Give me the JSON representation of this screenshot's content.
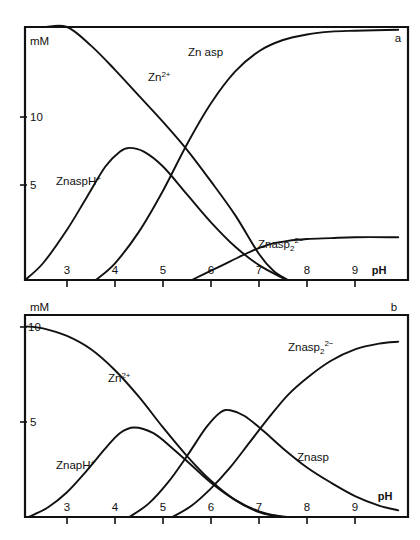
{
  "figure": {
    "panel_a_id": "a",
    "panel_b_id": "b"
  },
  "axes": {
    "y_title": "mM",
    "x_title": "pH",
    "panel_a": {
      "y_ticks": [
        "10",
        "5"
      ],
      "x_ticks": [
        "3",
        "4",
        "5",
        "6",
        "7",
        "8",
        "9"
      ]
    },
    "panel_b": {
      "y_ticks": [
        "10",
        "5"
      ],
      "x_ticks": [
        "3",
        "4",
        "5",
        "6",
        "7",
        "8",
        "9"
      ]
    }
  },
  "labels": {
    "a": {
      "zn2plus": "Zn",
      "zn2plus_sup": "2+",
      "znasp": "Zn asp",
      "znasph": "ZnaspH",
      "znasph_sup": "+",
      "znasp2": "Znasp",
      "znasp2_sub": "2",
      "znasp2_sup": "2−"
    },
    "b": {
      "zn2plus": "Zn",
      "zn2plus_sup": "2+",
      "znasp": "Znasp",
      "znasph": "ZnapH",
      "znasph_sup": "+",
      "znasp2": "Znasp",
      "znasp2_sub": "2",
      "znasp2_sup": "2−"
    }
  },
  "chart_data": [
    {
      "type": "line",
      "panel": "a",
      "title": "",
      "xlabel": "pH",
      "ylabel": "mM",
      "xlim": [
        2.1,
        9.9
      ],
      "ylim": [
        0,
        13.6
      ],
      "xticks": [
        3,
        4,
        5,
        6,
        7,
        8,
        9
      ],
      "yticks": [
        5,
        10
      ],
      "grid": false,
      "legend": "inline-annotations",
      "series": [
        {
          "name": "Zn2+",
          "x": [
            2.1,
            2.5,
            3.0,
            3.5,
            4.0,
            4.5,
            5.0,
            5.5,
            6.0,
            6.5,
            7.0,
            7.3,
            7.6
          ],
          "values": [
            16.3,
            15.3,
            14.0,
            12.6,
            11.3,
            9.9,
            8.5,
            7.0,
            5.3,
            3.5,
            1.4,
            0.5,
            0.0
          ]
        },
        {
          "name": "Zn asp",
          "x": [
            3.6,
            4.0,
            4.5,
            5.0,
            5.5,
            6.0,
            6.5,
            7.0,
            7.5,
            8.0,
            8.5,
            9.0,
            9.9
          ],
          "values": [
            0.0,
            0.9,
            2.6,
            4.8,
            7.3,
            9.5,
            11.2,
            12.3,
            12.9,
            13.2,
            13.35,
            13.4,
            13.45
          ]
        },
        {
          "name": "ZnaspH+",
          "x": [
            2.1,
            2.5,
            3.0,
            3.4,
            3.8,
            4.1,
            4.3,
            4.6,
            5.0,
            5.5,
            6.0,
            6.5,
            7.0,
            7.5
          ],
          "values": [
            0.0,
            0.9,
            2.7,
            4.4,
            6.1,
            6.9,
            7.1,
            6.9,
            6.1,
            4.6,
            3.1,
            1.8,
            0.8,
            0.1
          ]
        },
        {
          "name": "Znasp2-2",
          "x": [
            5.6,
            6.0,
            6.4,
            6.8,
            7.2,
            7.6,
            8.0,
            8.5,
            9.0,
            9.9
          ],
          "values": [
            0.0,
            0.5,
            1.0,
            1.5,
            1.9,
            2.1,
            2.2,
            2.25,
            2.3,
            2.3
          ]
        }
      ]
    },
    {
      "type": "line",
      "panel": "b",
      "title": "",
      "xlabel": "pH",
      "ylabel": "mM",
      "xlim": [
        2.1,
        9.9
      ],
      "ylim": [
        0,
        10.6
      ],
      "xticks": [
        3,
        4,
        5,
        6,
        7,
        8,
        9
      ],
      "yticks": [
        5,
        10
      ],
      "grid": false,
      "legend": "inline-annotations",
      "series": [
        {
          "name": "Zn2+",
          "x": [
            2.1,
            2.5,
            3.0,
            3.5,
            4.0,
            4.5,
            5.0,
            5.5,
            6.0,
            6.5,
            7.0,
            7.3,
            7.6
          ],
          "values": [
            10.0,
            9.9,
            9.5,
            8.8,
            7.7,
            6.3,
            4.7,
            3.2,
            1.9,
            0.9,
            0.25,
            0.08,
            0.0
          ]
        },
        {
          "name": "ZnapH+",
          "x": [
            2.2,
            2.6,
            3.0,
            3.4,
            3.8,
            4.1,
            4.4,
            4.8,
            5.2,
            5.6,
            6.0,
            6.5,
            7.0,
            7.5
          ],
          "values": [
            0.0,
            0.5,
            1.3,
            2.4,
            3.6,
            4.4,
            4.7,
            4.4,
            3.6,
            2.7,
            1.8,
            0.9,
            0.3,
            0.0
          ]
        },
        {
          "name": "Znasp",
          "x": [
            4.3,
            4.7,
            5.1,
            5.5,
            5.9,
            6.2,
            6.4,
            6.7,
            7.1,
            7.5,
            8.0,
            8.5,
            9.0,
            9.5,
            9.9
          ],
          "values": [
            0.0,
            0.7,
            1.8,
            3.2,
            4.7,
            5.5,
            5.6,
            5.3,
            4.5,
            3.6,
            2.6,
            1.8,
            1.1,
            0.6,
            0.35
          ]
        },
        {
          "name": "Znasp2-2",
          "x": [
            5.2,
            5.6,
            6.0,
            6.4,
            6.8,
            7.2,
            7.6,
            8.0,
            8.5,
            9.0,
            9.5,
            9.9
          ],
          "values": [
            0.0,
            0.6,
            1.5,
            2.6,
            3.9,
            5.2,
            6.4,
            7.3,
            8.2,
            8.8,
            9.1,
            9.2
          ]
        }
      ]
    }
  ]
}
